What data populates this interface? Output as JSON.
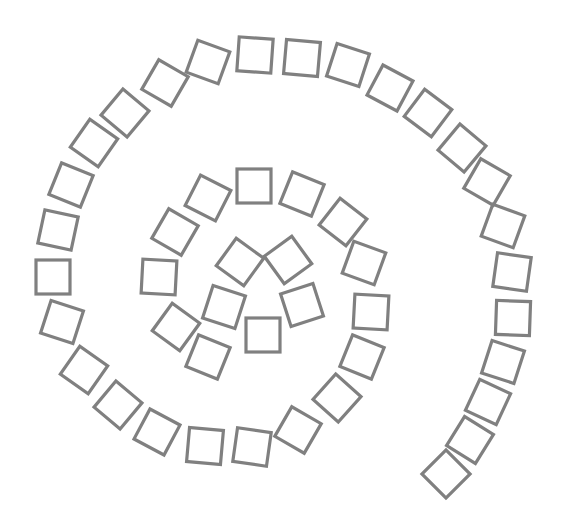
{
  "diagram": {
    "title": "",
    "stroke_color": "#808080",
    "background": "#ffffff",
    "square_size": 34,
    "squares": [
      {
        "x": 263,
        "y": 335,
        "r": 0
      },
      {
        "x": 302,
        "y": 305,
        "r": 72
      },
      {
        "x": 288,
        "y": 260,
        "r": 144
      },
      {
        "x": 240,
        "y": 262,
        "r": 216
      },
      {
        "x": 224,
        "y": 307,
        "r": 288
      },
      {
        "x": 208,
        "y": 357,
        "r": 22
      },
      {
        "x": 176,
        "y": 327,
        "r": 36
      },
      {
        "x": 159,
        "y": 277,
        "r": 3
      },
      {
        "x": 175,
        "y": 232,
        "r": 30
      },
      {
        "x": 208,
        "y": 198,
        "r": 27
      },
      {
        "x": 254,
        "y": 186,
        "r": 0
      },
      {
        "x": 302,
        "y": 194,
        "r": 22
      },
      {
        "x": 343,
        "y": 222,
        "r": 38
      },
      {
        "x": 364,
        "y": 263,
        "r": 20
      },
      {
        "x": 371,
        "y": 312,
        "r": 3
      },
      {
        "x": 362,
        "y": 357,
        "r": 22
      },
      {
        "x": 337,
        "y": 398,
        "r": 42
      },
      {
        "x": 298,
        "y": 430,
        "r": 30
      },
      {
        "x": 252,
        "y": 447,
        "r": 8
      },
      {
        "x": 205,
        "y": 446,
        "r": 5
      },
      {
        "x": 157,
        "y": 432,
        "r": 28
      },
      {
        "x": 118,
        "y": 405,
        "r": 40
      },
      {
        "x": 84,
        "y": 370,
        "r": 35
      },
      {
        "x": 62,
        "y": 322,
        "r": 18
      },
      {
        "x": 53,
        "y": 277,
        "r": 0
      },
      {
        "x": 58,
        "y": 230,
        "r": 12
      },
      {
        "x": 71,
        "y": 185,
        "r": 22
      },
      {
        "x": 94,
        "y": 143,
        "r": 35
      },
      {
        "x": 125,
        "y": 113,
        "r": 40
      },
      {
        "x": 165,
        "y": 83,
        "r": 30
      },
      {
        "x": 208,
        "y": 62,
        "r": 20
      },
      {
        "x": 255,
        "y": 55,
        "r": 4
      },
      {
        "x": 302,
        "y": 58,
        "r": 5
      },
      {
        "x": 348,
        "y": 65,
        "r": 18
      },
      {
        "x": 390,
        "y": 88,
        "r": 28
      },
      {
        "x": 428,
        "y": 113,
        "r": 37
      },
      {
        "x": 462,
        "y": 148,
        "r": 40
      },
      {
        "x": 487,
        "y": 182,
        "r": 30
      },
      {
        "x": 503,
        "y": 226,
        "r": 20
      },
      {
        "x": 512,
        "y": 272,
        "r": 8
      },
      {
        "x": 513,
        "y": 318,
        "r": 2
      },
      {
        "x": 503,
        "y": 362,
        "r": 18
      },
      {
        "x": 488,
        "y": 402,
        "r": 25
      },
      {
        "x": 470,
        "y": 440,
        "r": 32
      },
      {
        "x": 446,
        "y": 474,
        "r": 45
      }
    ]
  }
}
